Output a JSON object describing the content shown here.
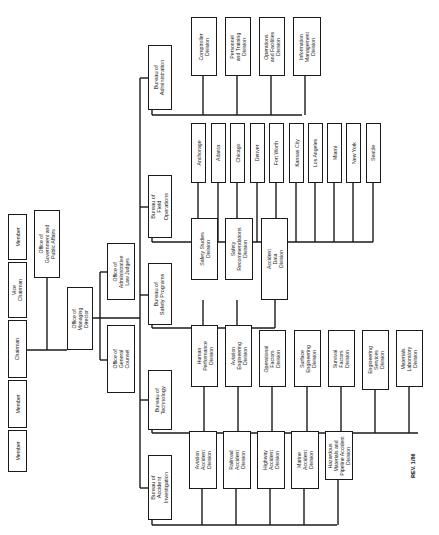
{
  "board": {
    "members": [
      {
        "label": "Member"
      },
      {
        "label": "Member"
      },
      {
        "label": "Chairman"
      },
      {
        "label": "Vice\nChairman"
      },
      {
        "label": "Member"
      }
    ]
  },
  "staff_offices": {
    "gov_affairs": "Office of\nGovernment and\nPublic Affairs",
    "managing_director": "Office of\nManaging\nDirector",
    "admin_law_judges": "Office of\nAdministrative\nLaw Judges",
    "general_counsel": "Office of\nGeneral\nCounsel"
  },
  "bureaus": [
    {
      "name": "Bureau of\nAdministration",
      "units": [
        "Comptroller\nDivision",
        "Personnel\nand Training\nDivision",
        "Operations\nand Facilities\nDivision",
        "Information\nManagement\nDivision"
      ]
    },
    {
      "name": "Bureau of\nField\nOperations",
      "units": [
        "Anchorage",
        "Atlanta",
        "Chicago",
        "Denver",
        "Fort Worth",
        "Kansas City",
        "Los Angeles",
        "Miami",
        "New York",
        "Seattle"
      ]
    },
    {
      "name": "Bureau of\nSafety Programs",
      "units": [
        "Safety Studies\nDivision",
        "Safety\nRecommendations\nDivision",
        "Accident\nData\nDivision"
      ]
    },
    {
      "name": "Bureau of\nTechnology",
      "units": [
        "Human\nPerformance\nDivision",
        "Aviation\nEngineering\nDivision",
        "Operational\nFactors\nDivision",
        "Surface\nEngineering\nDivision",
        "Survival\nFactors\nDivision",
        "Engineering\nServices\nDivision",
        "Materials\nLaboratory\nDivision"
      ]
    },
    {
      "name": "Bureau of\nAccident\nInvestigation",
      "units": [
        "Aviation\nAccident\nDivision",
        "Railroad\nAccident\nDivision",
        "Highway\nAccident\nDivision",
        "Marine\nAccident\nDivision",
        "Hazardous\nMaterials and\nPipeline Accident\nDivision"
      ]
    }
  ],
  "revision": "REV. 1/86",
  "colors": {
    "line": "#1a1a1a",
    "background": "#ffffff"
  }
}
